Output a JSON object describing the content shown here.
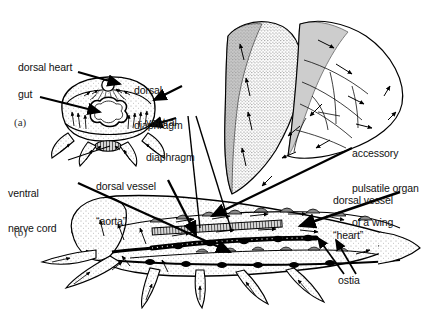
{
  "figure": {
    "background_color": "#ffffff",
    "ink_color": "#000000",
    "stipple_color": "#f2f2f2",
    "panels": [
      {
        "id": "a",
        "label": "(a)",
        "caption": "transverse cross-section of abdomen"
      },
      {
        "id": "b",
        "label": "(b)",
        "caption": "lateral view of whole insect"
      }
    ],
    "labels": [
      {
        "name": "dorsal-heart",
        "text": "dorsal heart",
        "panel": "a"
      },
      {
        "name": "gut",
        "text": "gut",
        "panel": "a"
      },
      {
        "name": "dorsal-diaphragm",
        "text": "dorsal\ndiaphragm",
        "line1": "dorsal",
        "line2": "diaphragm",
        "panel": "a"
      },
      {
        "name": "ventral-diaphragm",
        "text": "ventral\ndiaphragm",
        "line1": "ventral",
        "line2": "diaphragm",
        "panel": "a"
      },
      {
        "name": "ventral-nerve-cord",
        "text": "ventral\nnerve cord",
        "line1": "ventral",
        "line2": "nerve cord",
        "panel": "a"
      },
      {
        "name": "dorsal-vessel-aorta",
        "text": "dorsal vessel\n“aorta”",
        "line1": "dorsal vessel",
        "line2": "“aorta”",
        "panel": "b"
      },
      {
        "name": "accessory-pulsatile-organ",
        "text": "accessory\npulsatile organ\nof a wing",
        "line1": "accessory",
        "line2": "pulsatile organ",
        "line3": "of a wing",
        "panel": "b"
      },
      {
        "name": "dorsal-vessel-heart",
        "text": "dorsal vessel\n“heart”",
        "line1": "dorsal vessel",
        "line2": "“heart”",
        "panel": "b"
      },
      {
        "name": "ostia",
        "text": "ostia",
        "panel": "b"
      }
    ]
  }
}
